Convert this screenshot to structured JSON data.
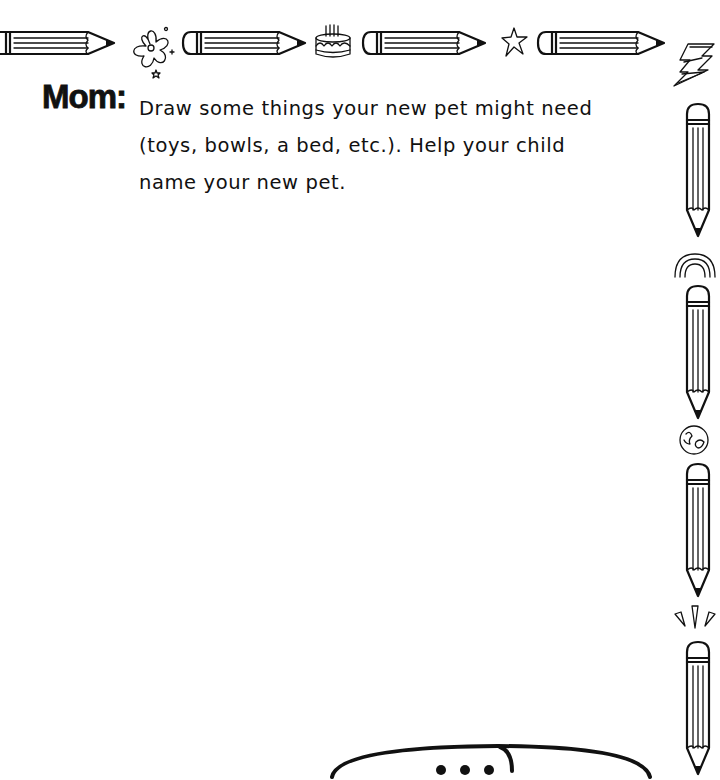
{
  "worksheet": {
    "prompt_label": "Mom:",
    "instruction_lines": [
      "Draw some things your new pet might need",
      "(toys, bowls, a bed, etc.). Help your child",
      "name your new pet."
    ],
    "instruction_text": "Draw some things your new pet might need (toys, bowls, a bed, etc.). Help your child name your new pet."
  },
  "border": {
    "top_icons": [
      "pencil-icon",
      "flower-icon",
      "pencil-icon",
      "cake-icon",
      "pencil-icon",
      "star-icon",
      "pencil-icon",
      "lightning-bolt-icon"
    ],
    "right_icons": [
      "lightning-bolt-icon",
      "pencil-icon",
      "rainbow-icon",
      "pencil-icon",
      "globe-icon",
      "pencil-icon",
      "sparkle-burst-icon",
      "pencil-icon"
    ]
  },
  "speech_bubble": {
    "content": "..."
  }
}
